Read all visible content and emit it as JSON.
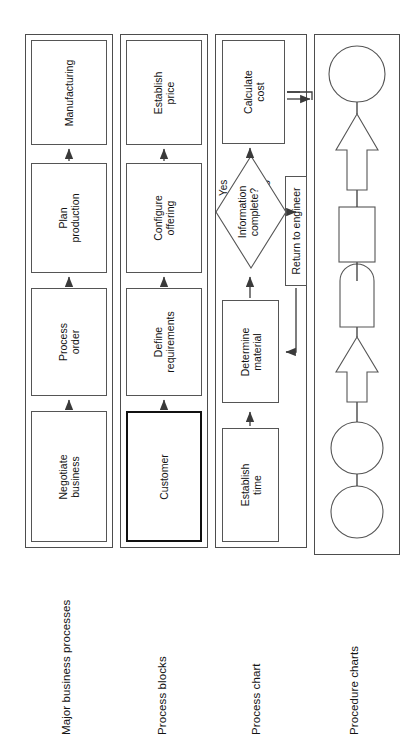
{
  "diagram": {
    "orientation": "rotated-90-ccw",
    "rows": [
      {
        "id": "major-business-processes",
        "label": "Major business processes",
        "nodes": [
          {
            "id": "negotiate-business",
            "text": "Negotiate\nbusiness",
            "shape": "rect",
            "emphasis": false
          },
          {
            "id": "process-order",
            "text": "Process\norder",
            "shape": "rect",
            "emphasis": false
          },
          {
            "id": "plan-production",
            "text": "Plan\nproduction",
            "shape": "rect",
            "emphasis": false
          },
          {
            "id": "manufacturing",
            "text": "Manufacturing",
            "shape": "rect",
            "emphasis": false
          }
        ]
      },
      {
        "id": "process-blocks",
        "label": "Process blocks",
        "nodes": [
          {
            "id": "customer",
            "text": "Customer",
            "shape": "rect",
            "emphasis": true
          },
          {
            "id": "define-requirements",
            "text": "Define\nrequirements",
            "shape": "rect",
            "emphasis": false
          },
          {
            "id": "configure-offering",
            "text": "Configure\noffering",
            "shape": "rect",
            "emphasis": false
          },
          {
            "id": "establish-price",
            "text": "Establish\nprice",
            "shape": "rect",
            "emphasis": false
          }
        ]
      },
      {
        "id": "process-chart",
        "label": "Process chart",
        "nodes": [
          {
            "id": "establish-time",
            "text": "Establish\ntime",
            "shape": "rect",
            "emphasis": false
          },
          {
            "id": "determine-material",
            "text": "Determine\nmaterial",
            "shape": "rect",
            "emphasis": false
          },
          {
            "id": "information-complete",
            "text": "Information\ncomplete?",
            "shape": "diamond",
            "emphasis": false
          },
          {
            "id": "calculate-cost",
            "text": "Calculate\ncost",
            "shape": "rect",
            "emphasis": false
          },
          {
            "id": "return-to-engineer",
            "text": "Return to engineer",
            "shape": "rect",
            "emphasis": false
          }
        ],
        "edge_labels": [
          {
            "id": "yes",
            "text": "Yes"
          },
          {
            "id": "no",
            "text": "No"
          }
        ]
      },
      {
        "id": "procedure-charts",
        "label": "Procedure charts",
        "nodes": [
          {
            "id": "operation-1",
            "text": "",
            "shape": "circle",
            "emphasis": false
          },
          {
            "id": "operation-2",
            "text": "",
            "shape": "circle",
            "emphasis": false
          },
          {
            "id": "transport-1",
            "text": "",
            "shape": "arrow",
            "emphasis": false
          },
          {
            "id": "delay-1",
            "text": "",
            "shape": "delay",
            "emphasis": false
          },
          {
            "id": "inspection-1",
            "text": "",
            "shape": "rect-small",
            "emphasis": false
          },
          {
            "id": "transport-2",
            "text": "",
            "shape": "arrow",
            "emphasis": false
          },
          {
            "id": "operation-3",
            "text": "",
            "shape": "circle",
            "emphasis": false
          }
        ]
      }
    ],
    "colors": {
      "stroke": "#555555",
      "lane_stroke": "#4d4d4d",
      "emphasis_stroke": "#111111",
      "arrow": "#3a3a3a",
      "text": "#131313",
      "background": "#ffffff"
    }
  }
}
